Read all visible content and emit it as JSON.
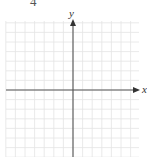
{
  "problem": {
    "number": "4"
  },
  "graph": {
    "x_label": "x",
    "y_label": "y",
    "grid_color": "#e6e6e6",
    "axis_color": "#555555",
    "grid": {
      "left": 6,
      "right": 139,
      "top": 21,
      "bottom": 157,
      "spacing": 9.6
    },
    "origin": {
      "x": 73,
      "y": 90
    }
  }
}
